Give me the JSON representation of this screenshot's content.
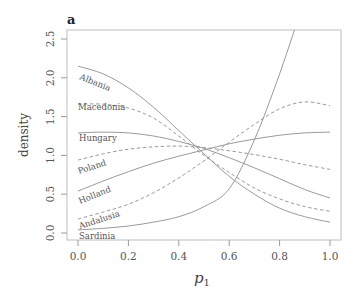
{
  "chart_data": {
    "type": "line",
    "panel_label": "a",
    "title": "",
    "xlabel": "p",
    "xlabel_subscript": "1",
    "ylabel": "density",
    "xlim": [
      0.0,
      1.0
    ],
    "ylim": [
      0.0,
      2.5
    ],
    "xticks": [
      0.0,
      0.2,
      0.4,
      0.6,
      0.8,
      1.0
    ],
    "xtick_labels": [
      "0.0",
      "0.2",
      "0.4",
      "0.6",
      "0.8",
      "1.0"
    ],
    "yticks": [
      0.0,
      0.5,
      1.0,
      1.5,
      2.0,
      2.5
    ],
    "ytick_labels": [
      "0.0",
      "0.5",
      "1.0",
      "1.5",
      "2.0",
      "2.5"
    ],
    "grid": false,
    "legend": "inline labels at left edge of curves",
    "x": [
      0.0,
      0.1,
      0.2,
      0.3,
      0.4,
      0.5,
      0.6,
      0.7,
      0.8,
      0.9,
      1.0
    ],
    "series": [
      {
        "name": "Albania",
        "style": "solid",
        "values": [
          2.15,
          2.05,
          1.87,
          1.62,
          1.32,
          1.02,
          0.73,
          0.5,
          0.32,
          0.21,
          0.14
        ]
      },
      {
        "name": "Macedonia",
        "style": "dashed",
        "values": [
          1.66,
          1.66,
          1.61,
          1.48,
          1.25,
          1.0,
          0.78,
          0.58,
          0.44,
          0.34,
          0.28
        ]
      },
      {
        "name": "Hungary",
        "style": "solid",
        "values": [
          1.29,
          1.3,
          1.29,
          1.25,
          1.18,
          1.09,
          0.97,
          0.84,
          0.7,
          0.56,
          0.45
        ]
      },
      {
        "name": "Poland",
        "style": "dashed",
        "values": [
          0.94,
          1.02,
          1.08,
          1.11,
          1.12,
          1.1,
          1.06,
          1.01,
          0.95,
          0.88,
          0.82
        ]
      },
      {
        "name": "Holland",
        "style": "solid",
        "values": [
          0.54,
          0.67,
          0.79,
          0.9,
          0.99,
          1.07,
          1.15,
          1.21,
          1.26,
          1.29,
          1.3
        ]
      },
      {
        "name": "Andalusia",
        "style": "dashed",
        "values": [
          0.18,
          0.27,
          0.37,
          0.52,
          0.71,
          0.93,
          1.17,
          1.4,
          1.6,
          1.69,
          1.64
        ]
      },
      {
        "name": "Sardinia",
        "style": "solid",
        "values": [
          0.04,
          0.06,
          0.09,
          0.14,
          0.21,
          0.34,
          0.57,
          1.2,
          2.05,
          3.0,
          3.8
        ]
      }
    ]
  }
}
